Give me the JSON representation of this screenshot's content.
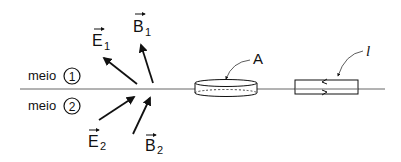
{
  "diagram": {
    "media": [
      {
        "label": "meio",
        "number": "1"
      },
      {
        "label": "meio",
        "number": "2"
      }
    ],
    "vectors": {
      "E1": {
        "symbol": "E",
        "subscript": "1"
      },
      "B1": {
        "symbol": "B",
        "subscript": "1"
      },
      "E2": {
        "symbol": "E",
        "subscript": "2"
      },
      "B2": {
        "symbol": "B",
        "subscript": "2"
      }
    },
    "surface_label": "A",
    "loop_label": "l",
    "colors": {
      "ink": "#111111",
      "interface": "#555555"
    }
  }
}
